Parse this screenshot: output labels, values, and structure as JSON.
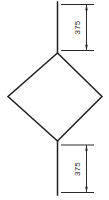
{
  "drawing": {
    "name": "diamond-outline-technical-drawing",
    "background": "#ffffff",
    "line_color": "#1f1f1f",
    "dim_line_color": "#2a2a2a",
    "text_color": "#1f1f1f"
  },
  "dimensions": {
    "top": {
      "label": "375"
    },
    "bottom": {
      "label": "375"
    }
  }
}
